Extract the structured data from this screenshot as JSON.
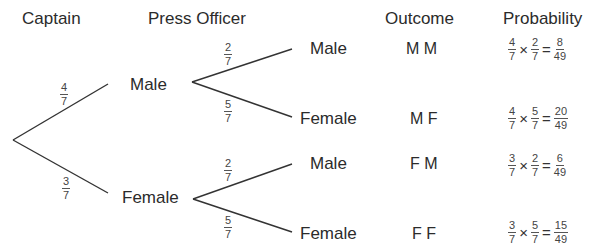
{
  "headers": {
    "captain": "Captain",
    "press_officer": "Press Officer",
    "outcome": "Outcome",
    "probability": "Probability"
  },
  "captain_branches": [
    {
      "label": "Male",
      "prob": {
        "num": "4",
        "den": "7"
      }
    },
    {
      "label": "Female",
      "prob": {
        "num": "3",
        "den": "7"
      }
    }
  ],
  "press_branches": [
    {
      "label": "Male",
      "prob": {
        "num": "2",
        "den": "7"
      }
    },
    {
      "label": "Female",
      "prob": {
        "num": "5",
        "den": "7"
      }
    },
    {
      "label": "Male",
      "prob": {
        "num": "2",
        "den": "7"
      }
    },
    {
      "label": "Female",
      "prob": {
        "num": "5",
        "den": "7"
      }
    }
  ],
  "outcomes": [
    {
      "outcome": "M M",
      "a": {
        "num": "4",
        "den": "7"
      },
      "b": {
        "num": "2",
        "den": "7"
      },
      "result": {
        "num": "8",
        "den": "49"
      }
    },
    {
      "outcome": "M F",
      "a": {
        "num": "4",
        "den": "7"
      },
      "b": {
        "num": "5",
        "den": "7"
      },
      "result": {
        "num": "20",
        "den": "49"
      }
    },
    {
      "outcome": "F M",
      "a": {
        "num": "3",
        "den": "7"
      },
      "b": {
        "num": "2",
        "den": "7"
      },
      "result": {
        "num": "6",
        "den": "49"
      }
    },
    {
      "outcome": "F F",
      "a": {
        "num": "3",
        "den": "7"
      },
      "b": {
        "num": "5",
        "den": "7"
      },
      "result": {
        "num": "15",
        "den": "49"
      }
    }
  ],
  "symbols": {
    "times": "×",
    "equals": "="
  }
}
